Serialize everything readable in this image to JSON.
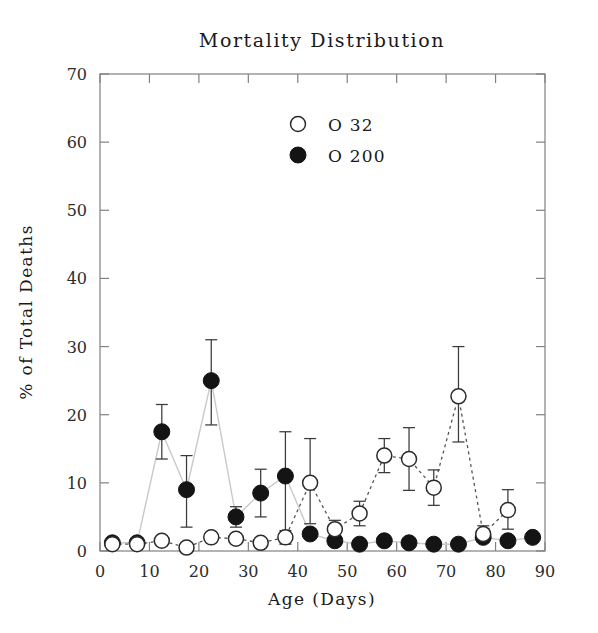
{
  "chart_data": {
    "type": "scatter",
    "title": "Mortality Distribution",
    "xlabel": "Age (Days)",
    "ylabel": "% of Total Deaths",
    "xlim": [
      0,
      90
    ],
    "ylim": [
      0,
      70
    ],
    "xticks": [
      0,
      10,
      20,
      30,
      40,
      50,
      60,
      70,
      80,
      90
    ],
    "yticks": [
      0,
      10,
      20,
      30,
      40,
      50,
      60,
      70
    ],
    "grid": false,
    "legend_position": "top-center",
    "legend": [
      "O 32",
      "O 200"
    ],
    "x": [
      2.5,
      7.5,
      12.5,
      17.5,
      22.5,
      27.5,
      32.5,
      37.5,
      42.5,
      47.5,
      52.5,
      57.5,
      62.5,
      67.5,
      72.5,
      77.5,
      82.5,
      87.5
    ],
    "series": [
      {
        "name": "O 32",
        "marker": "open-circle",
        "linestyle": "dotted",
        "values": [
          1.0,
          1.0,
          1.5,
          0.5,
          2.0,
          1.8,
          1.2,
          2.0,
          10.0,
          3.2,
          5.5,
          14.0,
          13.5,
          9.3,
          22.7,
          2.5,
          6.0,
          null
        ],
        "err_low": [
          0.5,
          0.5,
          0.7,
          0.3,
          0.7,
          0.6,
          0.5,
          1.0,
          6.0,
          1.3,
          1.8,
          2.5,
          4.6,
          2.6,
          6.7,
          1.2,
          2.8,
          null
        ],
        "err_high": [
          0.5,
          0.5,
          0.7,
          0.3,
          0.7,
          0.6,
          0.5,
          1.0,
          6.5,
          1.3,
          1.8,
          2.5,
          4.6,
          2.6,
          7.3,
          1.2,
          3.0,
          null
        ]
      },
      {
        "name": "O 200",
        "marker": "filled-circle",
        "linestyle": "solid",
        "values": [
          1.2,
          1.2,
          17.5,
          9.0,
          25.0,
          5.0,
          8.5,
          11.0,
          2.5,
          1.5,
          1.0,
          1.5,
          1.2,
          1.0,
          1.0,
          2.0,
          1.5,
          2.0
        ],
        "err_low": [
          0.4,
          0.4,
          4.0,
          5.5,
          6.5,
          1.5,
          3.5,
          9.5,
          0.0,
          0.0,
          0.0,
          0.0,
          0.0,
          0.0,
          0.0,
          0.0,
          0.0,
          0.0
        ],
        "err_high": [
          0.4,
          0.4,
          4.0,
          5.0,
          6.0,
          1.5,
          3.5,
          6.5,
          0.0,
          0.0,
          0.0,
          0.0,
          0.0,
          0.0,
          0.0,
          0.0,
          0.0,
          0.0
        ]
      }
    ],
    "colors": {
      "open_marker_fill": "#ffffff",
      "open_marker_stroke": "#2a2a2a",
      "filled_marker": "#141414",
      "open_line": "#555555",
      "filled_line": "#c9c9c9",
      "axis": "#808080",
      "text": "#1a1a1a",
      "background": "#ffffff"
    }
  }
}
